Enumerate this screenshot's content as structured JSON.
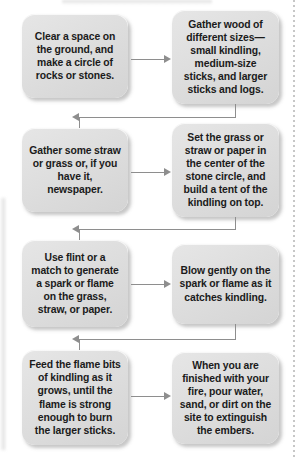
{
  "figure": {
    "type": "process-flowchart",
    "orientation": "serpentine-two-column",
    "colors": {
      "box_fill": "#dedede",
      "box_text": "#1b1b1b",
      "connector": "#8e8e8e",
      "page_background": "#ffffff"
    },
    "rows": 4,
    "columns": 2
  },
  "steps": [
    {
      "n": 1,
      "text": "Clear a space on the ground, and make a circle of rocks or stones."
    },
    {
      "n": 2,
      "text": "Gather wood of different sizes—small kindling, medium-size sticks, and larger sticks and logs."
    },
    {
      "n": 3,
      "text": "Gather some straw or grass or, if you have it, newspaper."
    },
    {
      "n": 4,
      "text": "Set the grass or straw or paper in the center of the stone circle, and build a tent of the kindling on top."
    },
    {
      "n": 5,
      "text": "Use flint or a match to generate a spark or flame on the grass, straw, or paper."
    },
    {
      "n": 6,
      "text": "Blow gently on the spark or flame as it catches kindling."
    },
    {
      "n": 7,
      "text": "Feed the flame bits of kindling as it grows, until the flame is strong enough to burn the larger sticks."
    },
    {
      "n": 8,
      "text": "When you are finished with your fire, pour water, sand, or dirt on the site to extinguish the embers."
    }
  ],
  "connectors": [
    {
      "id": "c1",
      "from": 1,
      "to": 2,
      "kind": "horizontal-right"
    },
    {
      "id": "c2",
      "from": 2,
      "to": 3,
      "kind": "wrap-down-left"
    },
    {
      "id": "c3",
      "from": 3,
      "to": 4,
      "kind": "horizontal-right"
    },
    {
      "id": "c4",
      "from": 4,
      "to": 5,
      "kind": "wrap-down-left"
    },
    {
      "id": "c5",
      "from": 5,
      "to": 6,
      "kind": "horizontal-right"
    },
    {
      "id": "c6",
      "from": 6,
      "to": 7,
      "kind": "wrap-down-left"
    },
    {
      "id": "c7",
      "from": 7,
      "to": 8,
      "kind": "horizontal-right"
    }
  ]
}
